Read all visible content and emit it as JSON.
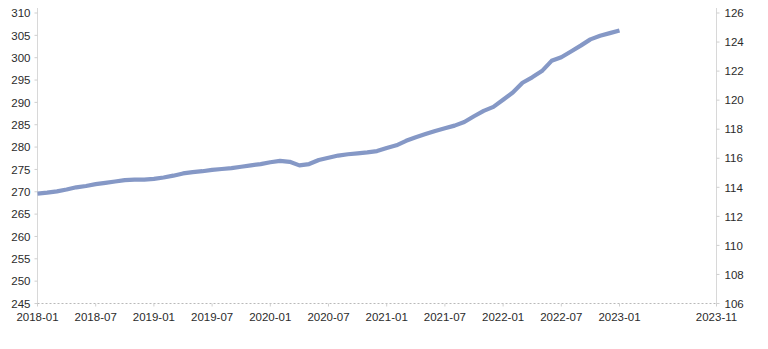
{
  "chart_data": {
    "type": "line",
    "title": "",
    "xlabel": "",
    "ylabel": "",
    "grid": false,
    "legend_position": "bottom-center",
    "axes": {
      "left": {
        "label": "",
        "ylim": [
          245,
          310
        ],
        "ticks": [
          245,
          250,
          255,
          260,
          265,
          270,
          275,
          280,
          285,
          290,
          295,
          300,
          305,
          310
        ],
        "series": "美国:PCE:季调"
      },
      "right": {
        "label": "",
        "ylim": [
          106,
          126
        ],
        "ticks": [
          106,
          108,
          110,
          112,
          114,
          116,
          118,
          120,
          122,
          124,
          126
        ],
        "series": "美国:CPI:非季调"
      },
      "x": {
        "tick_labels": [
          "2018-01",
          "2018-07",
          "2019-01",
          "2019-07",
          "2020-01",
          "2020-07",
          "2021-01",
          "2021-07",
          "2022-01",
          "2022-07",
          "2023-01",
          "2023-11"
        ],
        "tick_months": [
          "2018-01",
          "2018-07",
          "2019-01",
          "2019-07",
          "2020-01",
          "2020-07",
          "2021-01",
          "2021-07",
          "2022-01",
          "2022-07",
          "2023-01",
          "2023-11"
        ],
        "range": [
          "2018-01",
          "2023-11"
        ]
      }
    },
    "series": [
      {
        "name": "美国:PCE:季调",
        "color": "#8598c6",
        "axis": "left",
        "width": 4.2,
        "break_at_index": 61,
        "x": [
          "2018-01",
          "2018-02",
          "2018-03",
          "2018-04",
          "2018-05",
          "2018-06",
          "2018-07",
          "2018-08",
          "2018-09",
          "2018-10",
          "2018-11",
          "2018-12",
          "2019-01",
          "2019-02",
          "2019-03",
          "2019-04",
          "2019-05",
          "2019-06",
          "2019-07",
          "2019-08",
          "2019-09",
          "2019-10",
          "2019-11",
          "2019-12",
          "2020-01",
          "2020-02",
          "2020-03",
          "2020-04",
          "2020-05",
          "2020-06",
          "2020-07",
          "2020-08",
          "2020-09",
          "2020-10",
          "2020-11",
          "2020-12",
          "2021-01",
          "2021-02",
          "2021-03",
          "2021-04",
          "2021-05",
          "2021-06",
          "2021-07",
          "2021-08",
          "2021-09",
          "2021-10",
          "2021-11",
          "2021-12",
          "2022-01",
          "2022-02",
          "2022-03",
          "2022-04",
          "2022-05",
          "2022-06",
          "2022-07",
          "2022-08",
          "2022-09",
          "2022-10",
          "2022-11",
          "2022-12",
          "2023-01",
          "2023-02",
          "2023-03",
          "2023-04",
          "2023-05",
          "2023-06",
          "2023-07",
          "2023-08",
          "2023-09",
          "2023-10",
          "2023-11"
        ],
        "values": [
          249.6,
          249.8,
          250.1,
          250.5,
          251.0,
          251.3,
          251.7,
          252.0,
          252.3,
          252.6,
          252.7,
          252.7,
          252.9,
          253.2,
          253.6,
          254.1,
          254.4,
          254.6,
          254.9,
          255.1,
          255.3,
          255.6,
          255.9,
          256.2,
          256.6,
          256.9,
          256.7,
          255.9,
          256.2,
          257.1,
          257.6,
          258.1,
          258.4,
          258.6,
          258.8,
          259.1,
          259.8,
          260.4,
          261.4,
          262.2,
          262.9,
          263.6,
          264.2,
          264.8,
          265.6,
          266.9,
          268.1,
          269.0,
          270.6,
          272.2,
          274.4,
          275.6,
          277.0,
          279.3,
          280.1,
          281.4,
          282.7,
          284.1,
          284.9,
          285.5,
          286.1,
          287.3,
          288.2,
          288.9,
          289.3,
          289.7,
          290.4,
          291.2,
          292.0,
          292.8,
          293.1
        ],
        "pre_break_values": [
          249.6,
          249.8,
          250.1,
          250.5,
          251.0,
          251.3,
          251.7,
          252.0,
          252.3,
          252.6,
          252.7,
          252.7,
          252.9,
          253.2,
          253.6,
          254.1,
          254.4,
          254.6,
          254.9,
          255.1,
          255.3,
          255.6,
          255.9,
          256.2,
          256.6,
          256.9,
          256.7,
          255.9,
          256.2,
          257.1,
          257.6,
          258.1,
          258.4,
          258.6,
          258.8,
          259.1,
          259.8,
          260.4,
          261.4,
          262.2,
          262.9,
          263.6,
          264.2,
          264.8,
          265.6,
          266.9,
          268.1,
          269.0,
          270.6,
          272.2,
          274.4,
          275.6,
          277.0,
          279.3,
          280.1,
          281.4,
          282.7,
          284.1,
          284.9,
          285.5,
          286.1
        ],
        "note": "Series shows a level break (rebasing) at 2023-01: drops from about 306.1 to about 286.1"
      },
      {
        "name": "美国:CPI:非季调",
        "color": "#1b1b1b",
        "axis": "right",
        "width": 1.5,
        "x": [
          "2018-01",
          "2018-02",
          "2018-03",
          "2018-04",
          "2018-05",
          "2018-06",
          "2018-07",
          "2018-08",
          "2018-09",
          "2018-10",
          "2018-11",
          "2018-12",
          "2019-01",
          "2019-02",
          "2019-03",
          "2019-04",
          "2019-05",
          "2019-06",
          "2019-07",
          "2019-08",
          "2019-09",
          "2019-10",
          "2019-11",
          "2019-12",
          "2020-01",
          "2020-02",
          "2020-03",
          "2020-04",
          "2020-05",
          "2020-06",
          "2020-07",
          "2020-08",
          "2020-09",
          "2020-10",
          "2020-11",
          "2020-12",
          "2021-01",
          "2021-02",
          "2021-03",
          "2021-04",
          "2021-05",
          "2021-06",
          "2021-07",
          "2021-08",
          "2021-09",
          "2021-10",
          "2021-11",
          "2021-12",
          "2022-01",
          "2022-02",
          "2022-03",
          "2022-04",
          "2022-05",
          "2022-06",
          "2022-07",
          "2022-08",
          "2022-09",
          "2022-10",
          "2022-11",
          "2022-12",
          "2023-01",
          "2023-02",
          "2023-03",
          "2023-04",
          "2023-05",
          "2023-06",
          "2023-07",
          "2023-08",
          "2023-09",
          "2023-10",
          "2023-11"
        ],
        "values": [
          107.6,
          107.9,
          108.1,
          108.4,
          108.7,
          108.9,
          109.0,
          109.1,
          109.2,
          109.3,
          109.1,
          108.9,
          108.9,
          109.0,
          109.3,
          109.7,
          109.9,
          110.0,
          110.1,
          110.1,
          110.2,
          110.3,
          110.3,
          110.4,
          110.6,
          110.8,
          110.5,
          109.8,
          109.9,
          110.4,
          110.7,
          111.0,
          111.1,
          111.1,
          111.1,
          111.3,
          111.6,
          112.0,
          112.6,
          113.2,
          113.8,
          114.3,
          114.6,
          114.9,
          115.2,
          115.8,
          116.3,
          116.6,
          117.3,
          118.2,
          119.4,
          119.8,
          120.4,
          121.7,
          121.6,
          121.6,
          121.9,
          122.3,
          122.3,
          122.1,
          122.8,
          123.1,
          123.3,
          123.7,
          123.9,
          124.1,
          124.3,
          124.6,
          124.9,
          125.4,
          125.6
        ]
      }
    ]
  },
  "legend": {
    "items": [
      {
        "label": "美国:PCE:季调",
        "color": "#8598c6",
        "style": "thick"
      },
      {
        "label": "美国:CPI:非季调",
        "color": "#1b1b1b",
        "style": "thin"
      }
    ]
  }
}
